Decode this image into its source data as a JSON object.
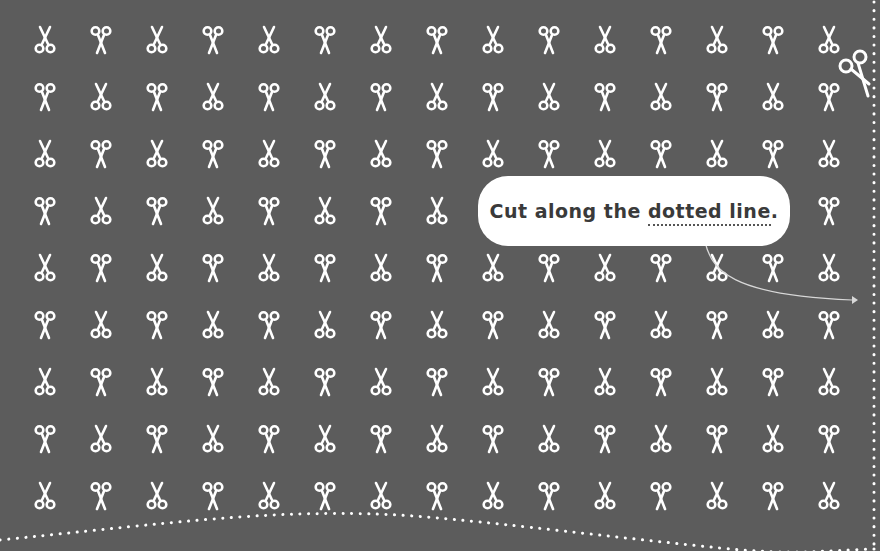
{
  "background_color": "#5c5c5c",
  "icon_color": "#ffffff",
  "grid": {
    "columns": 15,
    "rows": 9,
    "origin_x": 45,
    "origin_y": 40,
    "step_x": 56,
    "step_y": 57,
    "pattern": "checkerboard",
    "icon_a": "scissors-rings-down-icon",
    "icon_b": "scissors-rings-up-icon"
  },
  "callout": {
    "text_prefix": "Cut along the ",
    "text_underlined": "dotted line",
    "text_suffix": "."
  },
  "cut_lines": {
    "vertical_x": 874,
    "bottom_curve": "wavy dotted line along the bottom edge"
  },
  "accent_scissor": "scissors-cutting-icon"
}
